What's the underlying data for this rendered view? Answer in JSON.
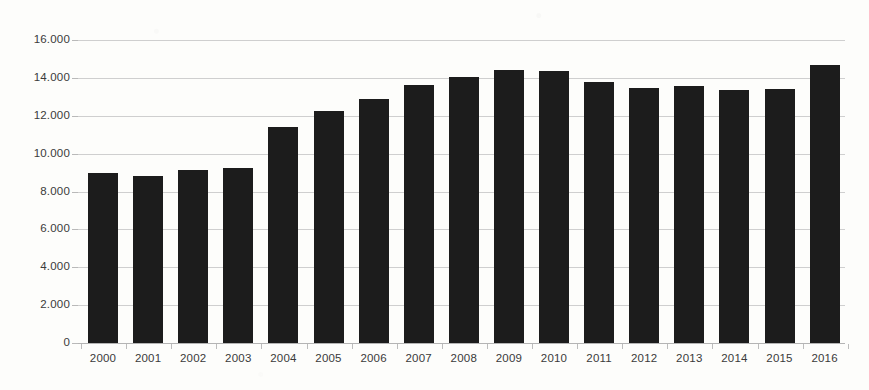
{
  "chart_data": {
    "type": "bar",
    "title": "",
    "subtitle": "",
    "xlabel": "",
    "ylabel": "",
    "categories": [
      "2000",
      "2001",
      "2002",
      "2003",
      "2004",
      "2005",
      "2006",
      "2007",
      "2008",
      "2009",
      "2010",
      "2011",
      "2012",
      "2013",
      "2014",
      "2015",
      "2016"
    ],
    "values": [
      9000,
      8800,
      9150,
      9250,
      11400,
      12250,
      12900,
      13600,
      14050,
      14400,
      14350,
      13800,
      13450,
      13550,
      13350,
      13400,
      14700
    ],
    "series": [
      {
        "name": "",
        "values": [
          9000,
          8800,
          9150,
          9250,
          11400,
          12250,
          12900,
          13600,
          14050,
          14400,
          14350,
          13800,
          13450,
          13550,
          13350,
          13400,
          14700
        ]
      }
    ],
    "ylim": [
      0,
      16000
    ],
    "ytick_values": [
      0,
      2000,
      4000,
      6000,
      8000,
      10000,
      12000,
      14000,
      16000
    ],
    "ytick_labels": [
      "0",
      "2.000",
      "4.000",
      "6.000",
      "8.000",
      "10.000",
      "12.000",
      "14.000",
      "16.000"
    ],
    "grid": true,
    "grid_axis": "y",
    "legend": false,
    "legend_position": "none",
    "bar_color": "#1c1c1c",
    "gridline_color": "#cfcfcf",
    "axis_label_color": "#3a3a3a",
    "background_color": "#fdfdfb",
    "annotations": []
  }
}
